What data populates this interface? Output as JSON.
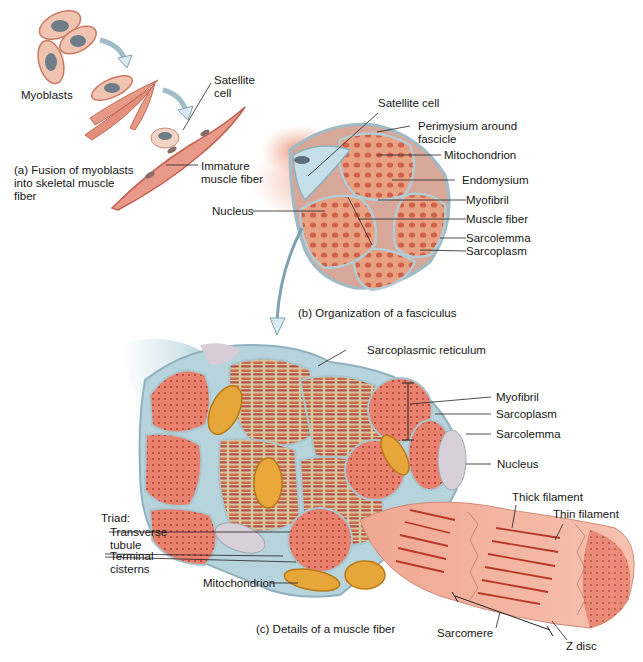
{
  "figure": {
    "panels": {
      "a": {
        "caption": "(a) Fusion of myoblasts\n     into skeletal muscle\n     fiber",
        "labels": {
          "myoblasts": "Myoblasts",
          "satellite_cell": "Satellite\ncell",
          "immature_fiber": "Immature\nmuscle fiber"
        }
      },
      "b": {
        "caption": "(b) Organization of a fasciculus",
        "labels": {
          "satellite_cell": "Satellite cell",
          "perimysium": "Perimysium around\nfascicle",
          "mitochondrion": "Mitochondrion",
          "endomysium": "Endomysium",
          "myofibril": "Myofibril",
          "muscle_fiber": "Muscle fiber",
          "sarcolemma": "Sarcolemma",
          "sarcoplasm": "Sarcoplasm",
          "nucleus": "Nucleus"
        }
      },
      "c": {
        "caption": "(c) Details of a muscle fiber",
        "labels": {
          "sarcoplasmic_reticulum": "Sarcoplasmic reticulum",
          "myofibril": "Myofibril",
          "sarcoplasm": "Sarcoplasm",
          "sarcolemma": "Sarcolemma",
          "nucleus": "Nucleus",
          "thick_filament": "Thick filament",
          "thin_filament": "Thin filament",
          "triad": "Triad:",
          "transverse_tubule": "Transverse\ntubule",
          "terminal_cisterns": "Terminal\ncisterns",
          "mitochondrion": "Mitochondrion",
          "sarcomere": "Sarcomere",
          "z_disc": "Z disc"
        }
      }
    },
    "colors": {
      "muscle": "#e07a66",
      "muscle_light": "#eea58f",
      "muscle_dark": "#c2503f",
      "membrane": "#a9c9d3",
      "membrane_light": "#d6e8ee",
      "mitochondria": "#e6a63a",
      "mito_dark": "#b97a1c",
      "nucleus": "#d7cdd7",
      "nucleus_dark": "#6e7a86",
      "sr": "#c9b78a",
      "filament": "#b8392a",
      "line": "#222222"
    }
  }
}
